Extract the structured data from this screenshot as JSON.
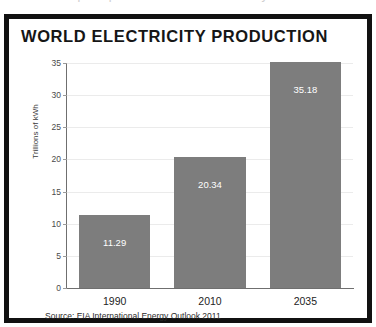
{
  "page": {
    "top_clipped_text": "the first and principal source of new electricity",
    "background_color": "#ffffff"
  },
  "figure": {
    "border_color": "#111111",
    "title": "WORLD ELECTRICITY PRODUCTION",
    "source_note": "Source: EIA International Energy Outlook 2011"
  },
  "chart_data": {
    "type": "bar",
    "title": "WORLD ELECTRICITY PRODUCTION",
    "categories": [
      "1990",
      "2010",
      "2035"
    ],
    "values": [
      11.29,
      20.34,
      35.18
    ],
    "value_labels": [
      "11.29",
      "20.34",
      "35.18"
    ],
    "series": [
      {
        "name": "World electricity production",
        "values": [
          11.29,
          20.34,
          35.18
        ]
      }
    ],
    "xlabel": "",
    "ylabel": "Trillions of kWh",
    "ylim": [
      0,
      35
    ],
    "y_ticks": [
      0,
      5,
      10,
      15,
      20,
      25,
      30,
      35
    ],
    "y_tick_labels": [
      "0",
      "5",
      "10",
      "15",
      "20",
      "25",
      "30",
      "35"
    ],
    "grid": true,
    "grid_axis": "y",
    "legend": false,
    "bar_color": "#7d7d7d",
    "value_label_color": "#ffffff",
    "gridline_color": "#ebebeb",
    "axis_color": "#6f6f6f",
    "source": "Source: EIA International Energy Outlook 2011"
  }
}
